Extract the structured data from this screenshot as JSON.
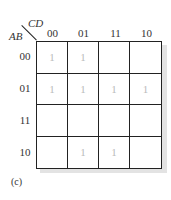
{
  "kmap": {
    "row_var": "AB",
    "col_var": "CD",
    "col_labels": [
      "00",
      "01",
      "11",
      "10"
    ],
    "row_labels": [
      "00",
      "01",
      "11",
      "10"
    ],
    "cells": [
      [
        "1",
        "1",
        "",
        ""
      ],
      [
        "1",
        "1",
        "1",
        "1"
      ],
      [
        "",
        "",
        "",
        ""
      ],
      [
        "",
        "1",
        "1",
        ""
      ]
    ]
  },
  "caption": "(c)"
}
